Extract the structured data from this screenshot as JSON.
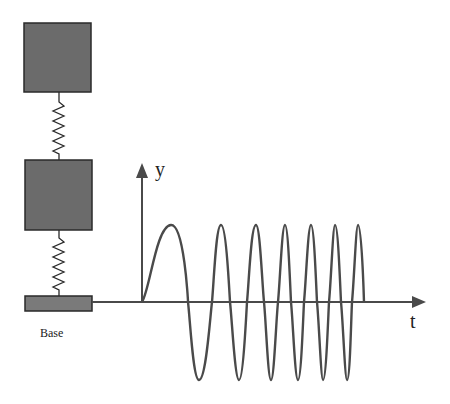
{
  "diagram": {
    "colors": {
      "mass_fill": "#6b6b6b",
      "outline": "#2a2a2a",
      "curve": "#4a4a4a",
      "axis": "#4a4a4a",
      "background": "#ffffff"
    },
    "components": {
      "upper_mass": {
        "label": ""
      },
      "lower_mass": {
        "label": ""
      },
      "upper_spring": {
        "label": ""
      },
      "lower_spring": {
        "label": ""
      },
      "base": {
        "label": "Base"
      }
    },
    "plot": {
      "y_axis_label": "y",
      "x_axis_label": "t",
      "signal_type": "chirp (increasing-frequency sinusoid)",
      "peaks_count": 7,
      "troughs_count": 6
    }
  }
}
